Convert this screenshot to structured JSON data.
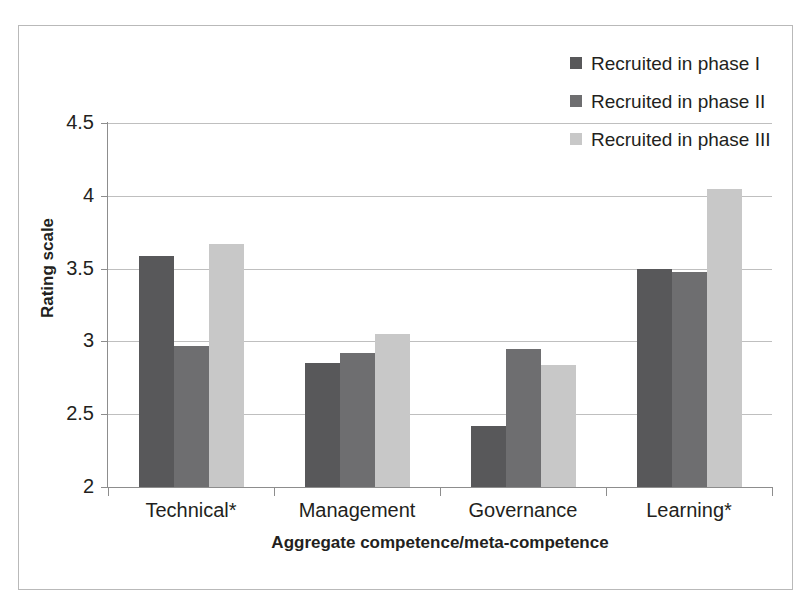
{
  "chart_data": {
    "type": "bar",
    "title": "",
    "xlabel": "Aggregate competence/meta-competence",
    "ylabel": "Rating scale",
    "categories": [
      "Technical*",
      "Management",
      "Governance",
      "Learning*"
    ],
    "series": [
      {
        "name": "Recruited in phase I",
        "color": "#58585a",
        "values": [
          3.59,
          2.85,
          2.42,
          3.5
        ]
      },
      {
        "name": "Recruited in phase II",
        "color": "#6e6e70",
        "values": [
          2.97,
          2.92,
          2.95,
          3.48
        ]
      },
      {
        "name": "Recruited in phase III",
        "color": "#c8c8c8",
        "values": [
          3.67,
          3.05,
          2.84,
          4.05
        ]
      }
    ],
    "ylim": [
      2,
      4.5
    ],
    "yticks": [
      "2",
      "2.5",
      "3",
      "3.5",
      "4",
      "4.5"
    ],
    "ytick_values": [
      2,
      2.5,
      3,
      3.5,
      4,
      4.5
    ],
    "grid": true,
    "legend_position": "top-right"
  },
  "legend": {
    "entries": [
      {
        "label": "Recruited in phase I",
        "color": "#58585a"
      },
      {
        "label": "Recruited in phase II",
        "color": "#6e6e70"
      },
      {
        "label": "Recruited in phase III",
        "color": "#c8c8c8"
      }
    ]
  },
  "colors": {
    "phase_1": "#58585a",
    "phase_2": "#6e6e70",
    "phase_3": "#c8c8c8",
    "grid": "#bfbfbf",
    "axis": "#8d8d8d",
    "frame": "#b9b9b9",
    "text": "#231f20"
  }
}
